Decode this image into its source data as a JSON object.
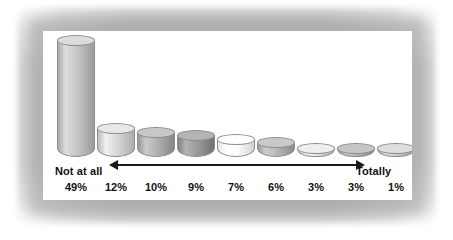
{
  "chart_data": {
    "type": "bar",
    "title": "",
    "subtitle": "",
    "xlabel": "",
    "ylabel": "",
    "grid": false,
    "legend": null,
    "ylim": [
      0,
      49
    ],
    "categories": [
      "1",
      "2",
      "3",
      "4",
      "5",
      "6",
      "7",
      "8",
      "9"
    ],
    "values": [
      49,
      12,
      10,
      9,
      7,
      6,
      3,
      3,
      1
    ],
    "value_labels": [
      "49%",
      "12%",
      "10%",
      "9%",
      "7%",
      "6%",
      "3%",
      "3%",
      "1%"
    ],
    "bar_colors": [
      "#c4c4c4",
      "#d6d6d6",
      "#b0b0b0",
      "#9a9a9a",
      "#fcfcfc",
      "#b4b4b4",
      "#e0e0e0",
      "#b0b0b0",
      "#c9c9c9"
    ],
    "bar_top_colors": [
      "#dcdcdc",
      "#e8e8e8",
      "#c8c8c8",
      "#b4b4b4",
      "#ffffff",
      "#c9c9c9",
      "#efefef",
      "#c6c6c6",
      "#dedede"
    ],
    "bar_style": "3d-cylinder",
    "outline_color": "#8d8d8d"
  },
  "axis": {
    "scale_low_label": "Not at all",
    "scale_high_label": "Totally",
    "arrow": "double-headed",
    "arrow_color": "#1a1a1a"
  },
  "panel": {
    "background": "#ffffff",
    "frame_color": "#b9b9b9"
  }
}
